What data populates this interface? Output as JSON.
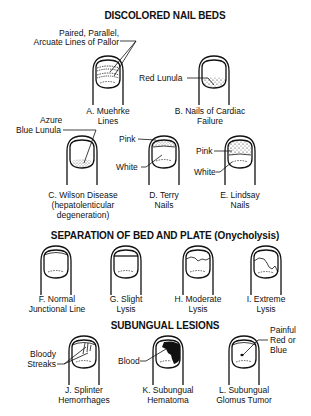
{
  "sections": [
    {
      "title": "DISCOLORED NAIL BEDS",
      "items": [
        {
          "id": "A",
          "caption_line1": "A. Muehrke",
          "caption_line2": "Lines",
          "callouts": [
            "Paired, Parallel,",
            "Arcuate Lines of Pallor"
          ]
        },
        {
          "id": "B",
          "caption_line1": "B. Nails of Cardiac",
          "caption_line2": "Failure",
          "callouts": [
            "Red Lunula"
          ]
        },
        {
          "id": "C",
          "caption_line1": "C. Wilson Disease",
          "caption_line2": "(hepatolenticular",
          "caption_line3": "degeneration)",
          "callouts": [
            "Azure",
            "Blue Lunula"
          ]
        },
        {
          "id": "D",
          "caption_line1": "D. Terry",
          "caption_line2": "Nails",
          "callouts": [
            "Pink",
            "White"
          ]
        },
        {
          "id": "E",
          "caption_line1": "E. Lindsay",
          "caption_line2": "Nails",
          "callouts": [
            "Pink",
            "White"
          ]
        }
      ]
    },
    {
      "title": "SEPARATION OF BED AND PLATE (Onycholysis)",
      "items": [
        {
          "id": "F",
          "caption_line1": "F. Normal",
          "caption_line2": "Junctional Line"
        },
        {
          "id": "G",
          "caption_line1": "G. Slight",
          "caption_line2": "Lysis"
        },
        {
          "id": "H",
          "caption_line1": "H. Moderate",
          "caption_line2": "Lysis"
        },
        {
          "id": "I",
          "caption_line1": "I. Extreme",
          "caption_line2": "Lysis"
        }
      ]
    },
    {
      "title": "SUBUNGUAL LESIONS",
      "items": [
        {
          "id": "J",
          "caption_line1": "J. Splinter",
          "caption_line2": "Hemorrhages",
          "callouts": [
            "Bloody",
            "Streaks"
          ]
        },
        {
          "id": "K",
          "caption_line1": "K. Subungual",
          "caption_line2": "Hematoma",
          "callouts": [
            "Blood"
          ]
        },
        {
          "id": "L",
          "caption_line1": "L. Subungual",
          "caption_line2": "Glomus Tumor",
          "callouts": [
            "Painful",
            "Red or",
            "Blue"
          ]
        }
      ]
    }
  ],
  "colors": {
    "ink": "#111111",
    "background": "#ffffff"
  }
}
